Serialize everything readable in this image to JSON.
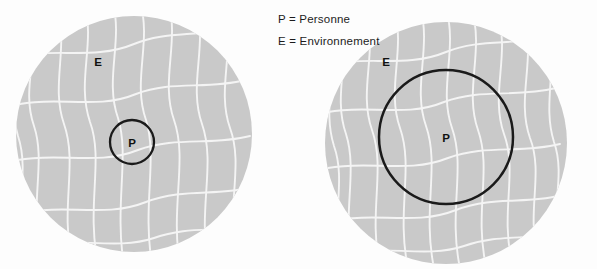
{
  "figure": {
    "type": "conceptual-diagram",
    "background_color": "#fdfdfd",
    "disc_fill_color": "#c9c9c9",
    "grain_line_color": "#f2f2f2",
    "outline_color": "#1a1a1a"
  },
  "legend": {
    "items": [
      {
        "text": "P = Personne"
      },
      {
        "text": "E = Environnement"
      }
    ]
  },
  "panels": [
    {
      "id": "left",
      "environment_label": "E",
      "person_label": "P",
      "disc": {
        "cx": 134,
        "cy": 134,
        "r": 118
      },
      "person_circle": {
        "cx": 132,
        "cy": 142,
        "r": 22
      }
    },
    {
      "id": "right",
      "environment_label": "E",
      "person_label": "P",
      "disc": {
        "cx": 446,
        "cy": 143,
        "r": 121
      },
      "person_circle": {
        "cx": 446,
        "cy": 137,
        "r": 67
      }
    }
  ]
}
